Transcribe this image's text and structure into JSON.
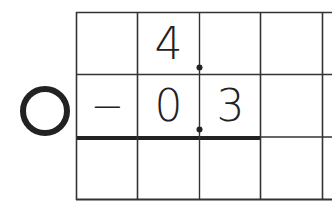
{
  "worksheet": {
    "operation": "subtraction",
    "rows": [
      {
        "cells": [
          "",
          "4",
          "",
          "",
          ""
        ]
      },
      {
        "cells": [
          "−",
          "0",
          "3",
          "",
          ""
        ]
      },
      {
        "cells": [
          "",
          "",
          "",
          "",
          ""
        ]
      }
    ],
    "decimal_point_column_boundary": 2,
    "marker": "circle-icon",
    "answer_row_index": 2
  },
  "colors": {
    "ink": "#222222",
    "grid": "#333333",
    "background": "#ffffff"
  }
}
